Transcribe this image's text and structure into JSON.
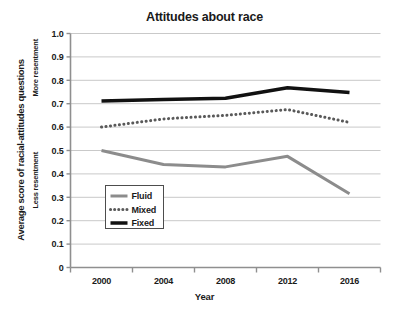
{
  "chart_data": {
    "type": "line",
    "title": "Attitudes about race",
    "xlabel": "Year",
    "ylabel": "Average score of racial-attitudes questions",
    "ylabel_top_note": "More resentment",
    "ylabel_bottom_note": "Less resentment",
    "categories": [
      "2000",
      "2004",
      "2008",
      "2012",
      "2016"
    ],
    "x": [
      2000,
      2004,
      2008,
      2012,
      2016
    ],
    "xlim": [
      1998,
      2018
    ],
    "ylim": [
      0,
      1.0
    ],
    "ytick_labels": [
      "0",
      "0.1",
      "0.2",
      "0.3",
      "0.4",
      "0.5",
      "0.6",
      "0.7",
      "0.8",
      "0.9",
      "1.0"
    ],
    "ytick_values": [
      0,
      0.1,
      0.2,
      0.3,
      0.4,
      0.5,
      0.6,
      0.7,
      0.8,
      0.9,
      1.0
    ],
    "grid": "horizontal",
    "legend_position": "lower-left-inside",
    "series": [
      {
        "name": "Fluid",
        "values": [
          0.5,
          0.44,
          0.43,
          0.475,
          0.315
        ],
        "color": "#8c8c8c",
        "style": "solid",
        "width": 3
      },
      {
        "name": "Mixed",
        "values": [
          0.6,
          0.635,
          0.65,
          0.675,
          0.62
        ],
        "color": "#595959",
        "style": "dotted",
        "width": 3
      },
      {
        "name": "Fixed",
        "values": [
          0.712,
          0.718,
          0.723,
          0.768,
          0.748
        ],
        "color": "#111111",
        "style": "solid",
        "width": 3.5
      }
    ],
    "axis_color": "#8f8f8f",
    "grid_color": "#c9c9c9",
    "background": "#ffffff"
  },
  "legend": {
    "items": [
      {
        "label": "Fluid"
      },
      {
        "label": "Mixed"
      },
      {
        "label": "Fixed"
      }
    ]
  }
}
